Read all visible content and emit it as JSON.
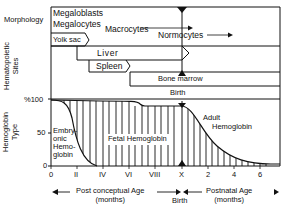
{
  "figure": {
    "row_labels": {
      "morphology": "Morphology",
      "hematopoietic_sites": [
        "Hematopoietic",
        "Sites"
      ],
      "hemoglobin_type": [
        "Hemoglobin",
        "Type"
      ]
    },
    "morphology": {
      "megaloblasts": "Megaloblasts",
      "megalocytes": "Megalocytes",
      "macrocytes": "Macrocytes",
      "normocytes": "Normocytes"
    },
    "sites": {
      "yolk_sac": "Yolk sac",
      "liver": "Liver",
      "spleen": "Spleen",
      "bone_marrow": "Bone marrow",
      "birth": "Birth"
    },
    "y_ticks": [
      "%100",
      "50",
      "0"
    ],
    "hemoglobin": {
      "embryonic": [
        "Embry-",
        "onic",
        "Hemo-",
        "globin"
      ],
      "fetal": "Fetal Hemoglobin",
      "adult": [
        "Adult",
        "Hemoglobin"
      ]
    },
    "x_ticks": [
      "0",
      "II",
      "IV",
      "VI",
      "VIII",
      "X",
      "2",
      "4",
      "6"
    ],
    "axis_captions": {
      "post_conceptual": [
        "Post conceptual  Age",
        "(months)"
      ],
      "birth": "Birth",
      "postnatal": [
        "Postnatal Age",
        "(months)"
      ]
    }
  }
}
